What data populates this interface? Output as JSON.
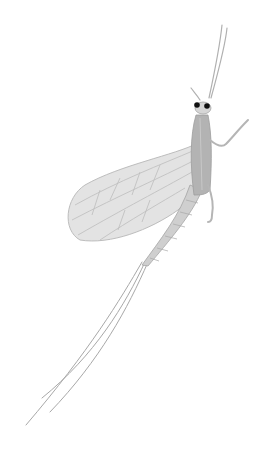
{
  "image": {
    "subject": "Pencil-style illustration of a mayfly",
    "background": "#ffffff",
    "colors": {
      "wing": "#d9d9d9",
      "wing_vein": "#b5b5b5",
      "thorax": "#a8a8a8",
      "abdomen": "#c4c4c4",
      "outline": "#9a9a9a",
      "eye": "#111111",
      "tail": "#aaaaaa"
    }
  }
}
